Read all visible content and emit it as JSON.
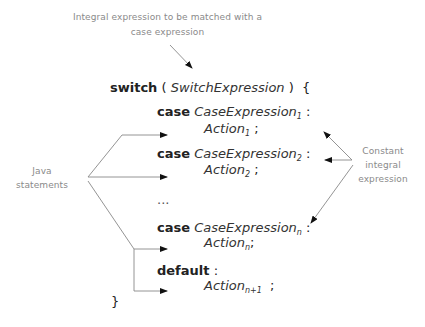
{
  "top_note": {
    "line1": "Integral expression to be matched with a",
    "line2": "case expression"
  },
  "code": {
    "switch_kw": "switch",
    "open_paren": "(",
    "switch_expr": "SwitchExpression",
    "close_paren": ")",
    "open_brace": "{",
    "cases": [
      {
        "kw": "case",
        "expr": "CaseExpression",
        "expr_sub": "1",
        "colon": ":",
        "action": "Action",
        "action_sub": "1",
        "semi": ";"
      },
      {
        "kw": "case",
        "expr": "CaseExpression",
        "expr_sub": "2",
        "colon": ":",
        "action": "Action",
        "action_sub": "2",
        "semi": ";"
      },
      {
        "kw": "case",
        "expr": "CaseExpression",
        "expr_sub": "n",
        "colon": ":",
        "action": "Action",
        "action_sub": "n",
        "semi": ";"
      }
    ],
    "ellipsis": "...",
    "default_kw": "default",
    "default_colon": ":",
    "default_action": "Action",
    "default_action_sub": "n+1",
    "default_semi": ";",
    "close_brace": "}"
  },
  "left_note": {
    "line1": "Java",
    "line2": "statements"
  },
  "right_note": {
    "line1": "Constant",
    "line2": "integral",
    "line3": "expression"
  },
  "colors": {
    "annotation_text": "#8a8a8a",
    "code_text": "#222222",
    "line": "#888888",
    "arrowhead": "#111111"
  }
}
